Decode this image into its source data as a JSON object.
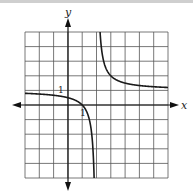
{
  "chart_data": {
    "type": "line",
    "title": "",
    "function": "y = 1 + 1/(x - 2)",
    "xlabel": "x",
    "ylabel": "y",
    "xlim": [
      -3,
      7
    ],
    "ylim": [
      -5,
      5
    ],
    "grid": true,
    "grid_step": 1,
    "tick_labels": {
      "x": "1",
      "y": "1"
    },
    "asymptotes": {
      "vertical": 2,
      "horizontal": 1
    },
    "series": [
      {
        "name": "left branch",
        "x": [
          -3,
          -2,
          -1,
          0,
          1,
          1.5,
          1.8,
          1.9
        ],
        "y": [
          0.8,
          0.75,
          0.667,
          0.5,
          0,
          -1,
          -4,
          -9
        ]
      },
      {
        "name": "right branch",
        "x": [
          2.2,
          2.25,
          2.5,
          3,
          4,
          5,
          6,
          7
        ],
        "y": [
          6,
          5,
          3,
          2,
          1.5,
          1.333,
          1.25,
          1.2
        ]
      }
    ],
    "curve_color": "#1a1a1a",
    "grid_color": "#555555"
  }
}
